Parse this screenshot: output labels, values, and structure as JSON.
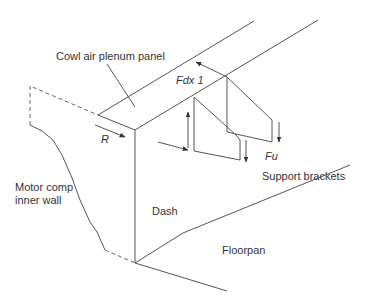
{
  "diagram": {
    "type": "isometric structural schematic",
    "labels": {
      "cowl_panel": "Cowl air plenum panel",
      "force_fdx": "Fdx 1",
      "reaction": "R",
      "force_fu": "Fu",
      "support_brackets": "Support brackets",
      "motor_comp_line1": "Motor comp",
      "motor_comp_line2": "inner wall",
      "dash": "Dash",
      "floorpan": "Floorpan"
    },
    "colors": {
      "line": "#555555",
      "text": "#333333",
      "background": "#ffffff"
    }
  }
}
